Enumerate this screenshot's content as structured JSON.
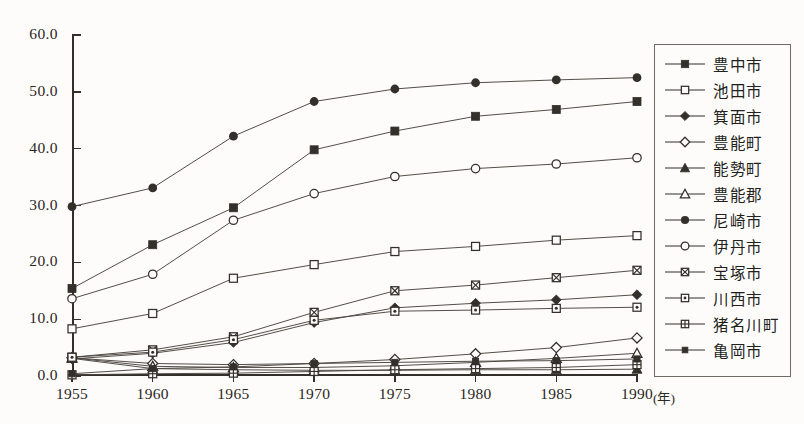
{
  "chart_data": {
    "type": "line",
    "title": "",
    "xlabel": "年",
    "ylabel": "",
    "x": [
      1955,
      1960,
      1965,
      1970,
      1975,
      1980,
      1985,
      1990
    ],
    "xtick_labels": [
      "1955",
      "1960",
      "1965",
      "1970",
      "1975",
      "1980",
      "1985",
      "1990"
    ],
    "x_unit_label": "(年)",
    "ytick_labels": [
      "60.0",
      "50.0",
      "40.0",
      "30.0",
      "20.0",
      "10.0",
      "0.0"
    ],
    "ytick_values": [
      60.0,
      50.0,
      40.0,
      30.0,
      20.0,
      10.0,
      0.0
    ],
    "ylim": [
      0.0,
      60.0
    ],
    "xlim": [
      1955,
      1990
    ],
    "grid": false,
    "legend_position": "right",
    "series": [
      {
        "name": "豊中市",
        "marker": "filled-square",
        "values": [
          15.4,
          23.1,
          29.6,
          39.8,
          43.1,
          45.7,
          46.9,
          48.3
        ]
      },
      {
        "name": "池田市",
        "marker": "open-square",
        "values": [
          8.3,
          11.0,
          17.2,
          19.6,
          21.9,
          22.8,
          23.9,
          24.7
        ]
      },
      {
        "name": "箕面市",
        "marker": "filled-diamond",
        "values": [
          3.0,
          4.0,
          5.9,
          9.4,
          12.0,
          12.8,
          13.4,
          14.3
        ]
      },
      {
        "name": "豊能町",
        "marker": "open-diamond",
        "values": [
          3.2,
          2.2,
          2.0,
          2.2,
          2.9,
          3.9,
          5.0,
          6.7
        ]
      },
      {
        "name": "能勢町",
        "marker": "filled-triangle",
        "values": [
          3.1,
          1.3,
          1.1,
          1.0,
          1.0,
          1.1,
          1.1,
          1.2
        ]
      },
      {
        "name": "豊能郡",
        "marker": "open-triangle",
        "values": [
          3.2,
          1.7,
          1.5,
          1.5,
          1.8,
          2.4,
          3.1,
          4.0
        ]
      },
      {
        "name": "尼崎市",
        "marker": "filled-circle",
        "values": [
          29.8,
          33.1,
          42.2,
          48.3,
          50.5,
          51.6,
          52.1,
          52.5
        ]
      },
      {
        "name": "伊丹市",
        "marker": "open-circle",
        "values": [
          13.6,
          17.9,
          27.4,
          32.1,
          35.1,
          36.5,
          37.3,
          38.4
        ]
      },
      {
        "name": "宝塚市",
        "marker": "crossed-square",
        "values": [
          3.3,
          4.6,
          6.9,
          11.2,
          15.0,
          16.0,
          17.3,
          18.6
        ]
      },
      {
        "name": "川西市",
        "marker": "dotted-square",
        "values": [
          3.3,
          4.2,
          6.4,
          9.8,
          11.4,
          11.6,
          11.9,
          12.1
        ]
      },
      {
        "name": "猪名川町",
        "marker": "gridded-square",
        "values": [
          0.2,
          0.4,
          0.5,
          0.8,
          1.1,
          1.3,
          1.5,
          2.0
        ]
      },
      {
        "name": "亀岡市",
        "marker": "small-square",
        "values": [
          0.4,
          1.3,
          1.6,
          2.2,
          2.4,
          2.6,
          2.7,
          3.0
        ]
      }
    ]
  },
  "legend": {
    "items": [
      {
        "label": "豊中市"
      },
      {
        "label": "池田市"
      },
      {
        "label": "箕面市"
      },
      {
        "label": "豊能町"
      },
      {
        "label": "能勢町"
      },
      {
        "label": "豊能郡"
      },
      {
        "label": "尼崎市"
      },
      {
        "label": "伊丹市"
      },
      {
        "label": "宝塚市"
      },
      {
        "label": "川西市"
      },
      {
        "label": "猪名川町"
      },
      {
        "label": "亀岡市"
      }
    ]
  },
  "colors": {
    "ink": "#332f2b",
    "line": "#4a453f",
    "background": "#fdfcfa",
    "legend_border": "#6e6a64"
  },
  "caption": ""
}
